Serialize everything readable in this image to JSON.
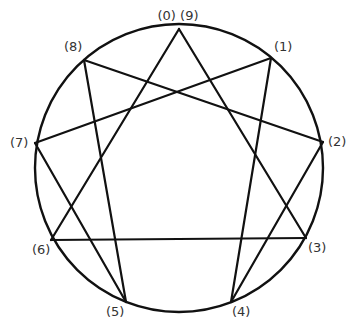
{
  "diagram": {
    "circle": {
      "cx": 179,
      "cy": 168,
      "r": 144,
      "stroke": "#111111",
      "stroke_width": 2.4
    },
    "points": [
      {
        "id": "9",
        "label": "(0) (9)",
        "x": 179,
        "y": 29,
        "lx": 178,
        "ly": 20
      },
      {
        "id": "1",
        "label": "(1)",
        "x": 271,
        "y": 58,
        "lx": 274,
        "ly": 51
      },
      {
        "id": "2",
        "label": "(2)",
        "x": 323,
        "y": 142,
        "lx": 328,
        "ly": 146
      },
      {
        "id": "3",
        "label": "(3)",
        "x": 306,
        "y": 238,
        "lx": 308,
        "ly": 252
      },
      {
        "id": "4",
        "label": "(4)",
        "x": 231,
        "y": 302,
        "lx": 232,
        "ly": 316
      },
      {
        "id": "5",
        "label": "(5)",
        "x": 126,
        "y": 302,
        "lx": 106,
        "ly": 316
      },
      {
        "id": "6",
        "label": "(6)",
        "x": 51,
        "y": 240,
        "lx": 32,
        "ly": 254
      },
      {
        "id": "7",
        "label": "(7)",
        "x": 35,
        "y": 143,
        "lx": 10,
        "ly": 147
      },
      {
        "id": "8",
        "label": "(8)",
        "x": 84,
        "y": 60,
        "lx": 64,
        "ly": 51
      }
    ],
    "lines": [
      {
        "from": "9",
        "to": "3"
      },
      {
        "from": "3",
        "to": "6"
      },
      {
        "from": "6",
        "to": "9"
      },
      {
        "from": "1",
        "to": "4"
      },
      {
        "from": "4",
        "to": "2"
      },
      {
        "from": "2",
        "to": "8"
      },
      {
        "from": "8",
        "to": "5"
      },
      {
        "from": "5",
        "to": "7"
      },
      {
        "from": "7",
        "to": "1"
      }
    ],
    "line_color": "#111111",
    "line_width": 2.2
  }
}
